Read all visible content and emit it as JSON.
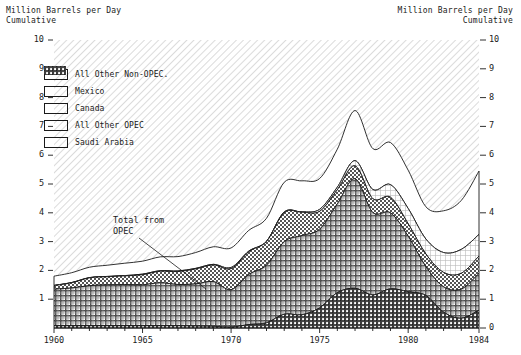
{
  "axis_titles": {
    "left": "Million Barrels per Day\nCumulative",
    "right": "Million Barrels per Day\nCumulative"
  },
  "legend": {
    "items": [
      {
        "label": "All Other Non-OPEC.",
        "pattern": "blank",
        "name": "all-other-non-opec"
      },
      {
        "label": "Mexico",
        "pattern": "fine-grid",
        "name": "mexico"
      },
      {
        "label": "Canada",
        "pattern": "checker",
        "name": "canada"
      },
      {
        "label": "All Other OPEC",
        "pattern": "cross-hatch",
        "name": "all-other-opec"
      },
      {
        "label": "Saudi Arabia",
        "pattern": "dense-hatch",
        "name": "saudi-arabia"
      }
    ]
  },
  "annotations": [
    {
      "text": "Total from\nOPEC",
      "name": "total-from-opec-annotation"
    }
  ],
  "chart_data": {
    "type": "area",
    "title": "",
    "xlabel": "",
    "ylabel": "Million Barrels per Day Cumulative",
    "stacked": true,
    "grid": false,
    "legend_position": "upper-left",
    "xlim": [
      1960,
      1984
    ],
    "ylim": [
      0,
      10
    ],
    "ytick_labels_left": [
      "10",
      "9",
      "8",
      "7",
      "6",
      "5",
      "4",
      "3",
      "2",
      "1"
    ],
    "ytick_labels_right": [
      "10",
      "9",
      "8",
      "7",
      "6",
      "5",
      "4",
      "3",
      "2",
      "1",
      "0"
    ],
    "xtick_labels": [
      "1960",
      "1965",
      "1970",
      "1975",
      "1980",
      "1984"
    ],
    "xtick_values": [
      1960,
      1965,
      1970,
      1975,
      1980,
      1984
    ],
    "x": [
      1960,
      1961,
      1962,
      1963,
      1964,
      1965,
      1966,
      1967,
      1968,
      1969,
      1970,
      1971,
      1972,
      1973,
      1974,
      1975,
      1976,
      1977,
      1978,
      1979,
      1980,
      1981,
      1982,
      1983,
      1984
    ],
    "series": [
      {
        "name": "Saudi Arabia",
        "pattern": "dense-hatch",
        "values": [
          0.08,
          0.08,
          0.08,
          0.08,
          0.08,
          0.08,
          0.08,
          0.08,
          0.07,
          0.06,
          0.03,
          0.12,
          0.18,
          0.48,
          0.46,
          0.7,
          1.23,
          1.38,
          1.15,
          1.36,
          1.26,
          1.13,
          0.55,
          0.34,
          0.62
        ]
      },
      {
        "name": "All Other OPEC",
        "pattern": "cross-hatch",
        "values": [
          1.27,
          1.31,
          1.39,
          1.42,
          1.43,
          1.42,
          1.49,
          1.43,
          1.46,
          1.55,
          1.3,
          1.74,
          2.0,
          2.52,
          2.75,
          2.73,
          3.08,
          3.8,
          2.86,
          2.64,
          1.93,
          1.0,
          0.88,
          1.01,
          1.28
        ]
      },
      {
        "name": "Canada",
        "pattern": "checker",
        "values": [
          0.12,
          0.18,
          0.27,
          0.28,
          0.3,
          0.35,
          0.4,
          0.45,
          0.52,
          0.58,
          0.73,
          0.79,
          0.82,
          1.01,
          0.81,
          0.62,
          0.49,
          0.45,
          0.48,
          0.54,
          0.43,
          0.44,
          0.5,
          0.55,
          0.6
        ]
      },
      {
        "name": "Mexico",
        "pattern": "fine-grid",
        "values": [
          0.01,
          0.01,
          0.01,
          0.01,
          0.01,
          0.02,
          0.02,
          0.02,
          0.02,
          0.02,
          0.04,
          0.02,
          0.01,
          0.02,
          0.01,
          0.07,
          0.09,
          0.18,
          0.32,
          0.44,
          0.53,
          0.52,
          0.69,
          0.83,
          0.75
        ]
      },
      {
        "name": "All Other Non-OPEC.",
        "pattern": "blank",
        "values": [
          0.32,
          0.34,
          0.36,
          0.39,
          0.43,
          0.45,
          0.48,
          0.5,
          0.55,
          0.61,
          0.68,
          0.72,
          0.8,
          1.03,
          1.08,
          1.07,
          1.32,
          1.74,
          1.42,
          1.46,
          1.33,
          1.12,
          1.45,
          1.7,
          2.2
        ]
      }
    ],
    "derived": {
      "total_from_opec_1960": 1.35,
      "total_all_1960": 1.8,
      "total_all_peak_1977": 7.55,
      "total_all_1984": 5.45
    }
  }
}
